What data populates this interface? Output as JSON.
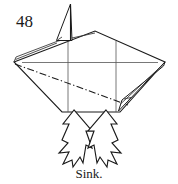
{
  "figure": {
    "step_number": "48",
    "caption": "Sink.",
    "ink_color": "#1a1a1a",
    "paper_color": "#ffffff",
    "crease_color": "#555555"
  },
  "diagram": {
    "model_outline_name": "folded-paper-outline",
    "sink_line_name": "sink-crease-dash-dot-line",
    "grid_creases": [
      {
        "name": "horizontal-crease",
        "orientation": "horizontal"
      },
      {
        "name": "vertical-crease-left",
        "orientation": "vertical"
      },
      {
        "name": "vertical-crease-right",
        "orientation": "vertical"
      }
    ],
    "flaps": [
      {
        "name": "top-spike-flap",
        "position": "top-left"
      },
      {
        "name": "right-edge-flap",
        "position": "right"
      },
      {
        "name": "left-edge-flap",
        "position": "left"
      }
    ],
    "arrows": [
      {
        "name": "push-arrow-left",
        "direction": "up-right",
        "label": ""
      },
      {
        "name": "push-arrow-right",
        "direction": "up-left",
        "label": ""
      }
    ]
  }
}
